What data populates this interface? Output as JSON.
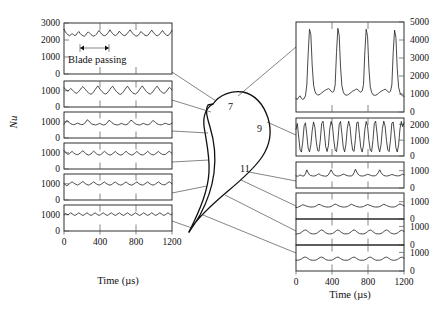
{
  "figure": {
    "title_hidden": "",
    "axis": {
      "y_label": "Nu",
      "x_label": "Time (µs)",
      "x_ticks": [
        "0",
        "400",
        "800",
        "1200"
      ],
      "x_range": [
        0,
        1200
      ]
    },
    "annotation": {
      "blade_passing_label": "Blade passing",
      "blade_passing_span_us": [
        180,
        480
      ]
    },
    "blade": {
      "name": "turbine-blade-cross-section",
      "labels": [
        {
          "text": "7",
          "x": 233,
          "y": 106
        },
        {
          "text": "9",
          "x": 262,
          "y": 128
        },
        {
          "text": "11",
          "x": 247,
          "y": 168
        }
      ]
    }
  },
  "chart_data": [
    {
      "id": "left-panel-1",
      "type": "line",
      "side": "left",
      "position": 1,
      "title": "",
      "xlabel": "Time (µs)",
      "ylabel": "Nu",
      "xlim": [
        0,
        1200
      ],
      "ylim": [
        0,
        3000
      ],
      "y_ticks": [
        0,
        1000,
        2000,
        3000
      ],
      "x_ticks": [
        0,
        400,
        800,
        1200
      ],
      "grid": false,
      "annotation": "Blade passing",
      "mean": 2300,
      "x": [
        0,
        15,
        30,
        45,
        60,
        75,
        90,
        105,
        120,
        135,
        150,
        165,
        180,
        195,
        210,
        225,
        240,
        255,
        270,
        285,
        300,
        315,
        330,
        345,
        360,
        375,
        390,
        405,
        420,
        435,
        450,
        465,
        480,
        495,
        510,
        525,
        540,
        555,
        570,
        585,
        600,
        615,
        630,
        645,
        660,
        675,
        690,
        705,
        720,
        735,
        750,
        765,
        780,
        795,
        810,
        825,
        840,
        855,
        870,
        885,
        900,
        915,
        930,
        945,
        960,
        975,
        990,
        1005,
        1020,
        1035,
        1050,
        1065,
        1080,
        1095,
        1110,
        1125,
        1140,
        1155,
        1170,
        1185,
        1200
      ],
      "values": [
        2620,
        2480,
        2380,
        2300,
        2250,
        2300,
        2380,
        2300,
        2260,
        2300,
        2420,
        2500,
        2380,
        2300,
        2250,
        2220,
        2280,
        2400,
        2480,
        2400,
        2320,
        2260,
        2230,
        2260,
        2340,
        2460,
        2560,
        2440,
        2340,
        2280,
        2250,
        2280,
        2360,
        2460,
        2600,
        2480,
        2380,
        2300,
        2260,
        2300,
        2400,
        2520,
        2420,
        2330,
        2280,
        2260,
        2300,
        2400,
        2500,
        2600,
        2480,
        2380,
        2300,
        2250,
        2230,
        2280,
        2380,
        2500,
        2420,
        2340,
        2280,
        2250,
        2280,
        2360,
        2480,
        2580,
        2460,
        2360,
        2290,
        2250,
        2280,
        2360,
        2460,
        2560,
        2440,
        2340,
        2280,
        2260,
        2320,
        2440,
        2560
      ]
    },
    {
      "id": "left-panel-2",
      "type": "line",
      "side": "left",
      "position": 2,
      "xlim": [
        0,
        1200
      ],
      "ylim": [
        0,
        1600
      ],
      "y_ticks": [
        0,
        1000
      ],
      "mean": 950,
      "values": [
        1180,
        1120,
        1020,
        980,
        1060,
        1140,
        1060,
        980,
        900,
        840,
        880,
        960,
        1060,
        1180,
        1260,
        1160,
        1060,
        960,
        880,
        820,
        780,
        840,
        940,
        1060,
        1180,
        1300,
        1180,
        1060,
        960,
        880,
        820,
        800,
        860,
        960,
        1080,
        1200,
        1280,
        1160,
        1040,
        940,
        860,
        800,
        780,
        840,
        940,
        1060,
        1180,
        1280,
        1160,
        1040,
        940,
        860,
        820,
        800,
        860,
        960,
        1080,
        1200,
        1300,
        1180,
        1060,
        960,
        880,
        820,
        800,
        860,
        960,
        1080,
        1200,
        1280,
        1160,
        1040,
        940,
        880,
        840,
        880,
        980,
        1100,
        1200,
        1140,
        1060
      ]
    },
    {
      "id": "left-panel-3",
      "type": "line",
      "side": "left",
      "position": 3,
      "xlim": [
        0,
        1200
      ],
      "ylim": [
        0,
        1600
      ],
      "y_ticks": [
        0,
        1000
      ],
      "mean": 880,
      "values": [
        860,
        960,
        1080,
        1020,
        940,
        880,
        840,
        820,
        840,
        880,
        920,
        880,
        840,
        820,
        840,
        900,
        1000,
        1120,
        1060,
        960,
        880,
        840,
        820,
        800,
        820,
        860,
        900,
        860,
        820,
        800,
        820,
        880,
        980,
        1100,
        1040,
        950,
        880,
        840,
        820,
        800,
        820,
        860,
        900,
        870,
        830,
        810,
        830,
        890,
        990,
        1100,
        1040,
        960,
        890,
        840,
        820,
        800,
        820,
        860,
        900,
        870,
        830,
        810,
        830,
        880,
        980,
        1080,
        1020,
        950,
        880,
        840,
        820,
        810,
        830,
        870,
        910,
        880,
        850,
        830,
        860,
        920
      ]
    },
    {
      "id": "left-panel-4",
      "type": "line",
      "side": "left",
      "position": 4,
      "xlim": [
        0,
        1200
      ],
      "ylim": [
        0,
        1600
      ],
      "y_ticks": [
        0,
        1000
      ],
      "mean": 930,
      "values": [
        1140,
        1040,
        960,
        900,
        940,
        1020,
        1080,
        1000,
        940,
        900,
        880,
        920,
        980,
        1060,
        1120,
        1040,
        960,
        900,
        860,
        880,
        940,
        1020,
        1100,
        1020,
        940,
        890,
        860,
        880,
        940,
        1020,
        1090,
        1010,
        940,
        890,
        860,
        880,
        940,
        1010,
        1080,
        1000,
        930,
        880,
        860,
        880,
        940,
        1020,
        1090,
        1010,
        940,
        890,
        860,
        880,
        940,
        1010,
        1080,
        1000,
        930,
        880,
        860,
        880,
        940,
        1010,
        1090,
        1010,
        940,
        890,
        870,
        890,
        950,
        1020,
        1080,
        1000,
        940,
        900,
        880,
        900,
        960,
        1030,
        1090,
        1020,
        960
      ]
    },
    {
      "id": "left-panel-5",
      "type": "line",
      "side": "left",
      "position": 5,
      "xlim": [
        0,
        1200
      ],
      "ylim": [
        0,
        1600
      ],
      "y_ticks": [
        0,
        1000
      ],
      "mean": 960,
      "values": [
        1000,
        940,
        880,
        920,
        1000,
        1060,
        1120,
        1060,
        1000,
        960,
        920,
        960,
        1020,
        1080,
        1140,
        1060,
        1000,
        950,
        920,
        940,
        1000,
        1060,
        1120,
        1050,
        990,
        950,
        920,
        940,
        1000,
        1060,
        1110,
        1040,
        980,
        940,
        920,
        940,
        1000,
        1060,
        1110,
        1040,
        980,
        940,
        920,
        940,
        1000,
        1060,
        1110,
        1040,
        980,
        940,
        920,
        940,
        1000,
        1060,
        1110,
        1040,
        980,
        940,
        920,
        940,
        1000,
        1060,
        1110,
        1040,
        980,
        940,
        920,
        940,
        1000,
        1060,
        1110,
        1050,
        990,
        950,
        930,
        950,
        1010,
        1070,
        1120,
        1060,
        1000
      ]
    },
    {
      "id": "left-panel-6",
      "type": "line",
      "side": "left",
      "position": 6,
      "xlim": [
        0,
        1200
      ],
      "ylim": [
        0,
        1600
      ],
      "y_ticks": [
        0,
        1000
      ],
      "mean": 990,
      "values": [
        1020,
        1080,
        1040,
        1000,
        1060,
        1120,
        1060,
        1000,
        960,
        1000,
        1060,
        1120,
        1060,
        1000,
        960,
        1000,
        1060,
        1120,
        1060,
        1000,
        960,
        1000,
        1060,
        1120,
        1060,
        1000,
        960,
        1000,
        1060,
        1120,
        1060,
        1000,
        960,
        1000,
        1060,
        1120,
        1060,
        1000,
        960,
        1000,
        1060,
        1120,
        1060,
        1000,
        960,
        1000,
        1060,
        1120,
        1060,
        1000,
        960,
        1000,
        1060,
        1120,
        1060,
        1000,
        960,
        1000,
        1060,
        1120,
        1060,
        1000,
        960,
        1000,
        1060,
        1120,
        1060,
        1000,
        960,
        1000,
        1060,
        1120,
        1060,
        1000,
        960,
        1000,
        1060,
        1120,
        1060,
        1000,
        1040
      ]
    },
    {
      "id": "right-panel-1",
      "type": "line",
      "side": "right",
      "position": 1,
      "xlim": [
        0,
        1200
      ],
      "ylim": [
        0,
        5000
      ],
      "y_ticks": [
        0,
        1000,
        2000,
        3000,
        4000,
        5000
      ],
      "x_ticks": [
        0,
        400,
        800,
        1200
      ],
      "peak_count": 4,
      "peak_value": 4600,
      "baseline": 800,
      "values": [
        750,
        700,
        820,
        900,
        760,
        700,
        740,
        900,
        1500,
        3200,
        4600,
        4300,
        2600,
        1500,
        1150,
        1000,
        950,
        950,
        1000,
        1060,
        1120,
        1180,
        1220,
        1260,
        1300,
        1250,
        1150,
        1100,
        1150,
        1500,
        3300,
        4650,
        4250,
        2500,
        1450,
        1120,
        980,
        940,
        940,
        980,
        1040,
        1100,
        1160,
        1200,
        1240,
        1280,
        1230,
        1140,
        1100,
        1160,
        1520,
        3350,
        4600,
        4200,
        2450,
        1400,
        1100,
        960,
        930,
        930,
        970,
        1030,
        1090,
        1150,
        1190,
        1230,
        1270,
        1220,
        1130,
        1090,
        1150,
        1500,
        3300,
        4550,
        4150,
        2400,
        1380,
        1080,
        950,
        900,
        880
      ]
    },
    {
      "id": "right-panel-2",
      "type": "line",
      "side": "right",
      "position": 2,
      "xlim": [
        0,
        1200
      ],
      "ylim": [
        0,
        2400
      ],
      "y_ticks": [
        0,
        1000,
        2000
      ],
      "oscillation_range": [
        200,
        2250
      ],
      "values": [
        1700,
        2050,
        1200,
        400,
        250,
        900,
        1900,
        2100,
        1350,
        500,
        260,
        700,
        1600,
        2150,
        1800,
        900,
        350,
        300,
        1000,
        2050,
        2200,
        1500,
        600,
        280,
        650,
        1700,
        2180,
        1900,
        1000,
        380,
        280,
        950,
        2000,
        2180,
        1400,
        550,
        260,
        750,
        1750,
        2200,
        1850,
        950,
        360,
        290,
        1050,
        2100,
        2150,
        1350,
        520,
        250,
        680,
        1680,
        2180,
        1880,
        980,
        370,
        270,
        980,
        2050,
        2200,
        1450,
        560,
        260,
        720,
        1720,
        2200,
        1900,
        1000,
        380,
        280,
        1000,
        2080,
        2150,
        1400,
        540,
        250,
        700,
        1700,
        2180,
        1850,
        2100
      ]
    },
    {
      "id": "right-panel-3",
      "type": "line",
      "side": "right",
      "position": 3,
      "xlim": [
        0,
        1200
      ],
      "ylim": [
        0,
        1500
      ],
      "y_ticks": [
        0,
        1000
      ],
      "baseline": 700,
      "values": [
        700,
        680,
        700,
        760,
        720,
        690,
        700,
        820,
        1050,
        880,
        760,
        720,
        700,
        690,
        700,
        730,
        780,
        820,
        760,
        720,
        700,
        690,
        680,
        700,
        760,
        900,
        1050,
        900,
        780,
        730,
        700,
        690,
        700,
        720,
        760,
        800,
        780,
        740,
        710,
        700,
        690,
        700,
        740,
        880,
        1080,
        920,
        790,
        730,
        700,
        690,
        700,
        720,
        760,
        790,
        770,
        740,
        710,
        700,
        700,
        720,
        780,
        900,
        1050,
        890,
        780,
        730,
        700,
        690,
        700,
        720,
        750,
        780,
        760,
        730,
        710,
        700,
        700,
        720,
        760,
        800,
        760
      ]
    },
    {
      "id": "right-panel-4",
      "type": "line",
      "side": "right",
      "position": 4,
      "xlim": [
        0,
        1200
      ],
      "ylim": [
        0,
        1500
      ],
      "y_ticks": [
        0,
        1000
      ],
      "baseline": 680,
      "values": [
        660,
        670,
        700,
        740,
        780,
        820,
        800,
        770,
        740,
        720,
        700,
        690,
        690,
        700,
        720,
        760,
        810,
        850,
        820,
        780,
        740,
        720,
        700,
        690,
        690,
        700,
        720,
        770,
        820,
        860,
        830,
        790,
        750,
        720,
        700,
        690,
        690,
        700,
        720,
        760,
        810,
        850,
        820,
        780,
        750,
        720,
        700,
        690,
        690,
        700,
        720,
        760,
        800,
        840,
        810,
        780,
        750,
        720,
        700,
        690,
        690,
        700,
        720,
        760,
        810,
        850,
        820,
        780,
        750,
        720,
        700,
        690,
        690,
        700,
        730,
        780,
        830,
        870,
        840,
        800,
        760
      ]
    },
    {
      "id": "right-panel-5",
      "type": "line",
      "side": "right",
      "position": 5,
      "xlim": [
        0,
        1200
      ],
      "ylim": [
        0,
        1400
      ],
      "y_ticks": [
        0,
        1000
      ],
      "baseline": 600,
      "values": [
        600,
        600,
        610,
        630,
        680,
        740,
        790,
        810,
        780,
        720,
        660,
        620,
        600,
        600,
        600,
        620,
        660,
        720,
        780,
        810,
        780,
        720,
        660,
        620,
        600,
        600,
        600,
        620,
        660,
        720,
        780,
        810,
        780,
        720,
        660,
        620,
        600,
        600,
        600,
        620,
        660,
        720,
        780,
        810,
        780,
        720,
        660,
        620,
        600,
        600,
        600,
        620,
        660,
        720,
        780,
        810,
        780,
        720,
        660,
        620,
        600,
        600,
        600,
        620,
        660,
        720,
        780,
        810,
        780,
        720,
        660,
        620,
        600,
        600,
        610,
        640,
        690,
        750,
        790,
        770,
        720
      ]
    },
    {
      "id": "right-panel-6",
      "type": "line",
      "side": "right",
      "position": 6,
      "xlim": [
        0,
        1200
      ],
      "ylim": [
        0,
        1400
      ],
      "y_ticks": [
        0,
        1000
      ],
      "baseline": 580,
      "values": [
        580,
        580,
        590,
        610,
        650,
        700,
        740,
        750,
        720,
        670,
        620,
        590,
        580,
        580,
        580,
        600,
        640,
        690,
        730,
        750,
        720,
        670,
        620,
        590,
        580,
        580,
        580,
        600,
        640,
        690,
        730,
        750,
        720,
        670,
        620,
        590,
        580,
        580,
        580,
        600,
        640,
        690,
        730,
        750,
        720,
        670,
        620,
        590,
        580,
        580,
        580,
        600,
        640,
        690,
        730,
        750,
        720,
        670,
        620,
        590,
        580,
        580,
        580,
        600,
        640,
        690,
        730,
        750,
        720,
        670,
        620,
        590,
        580,
        580,
        590,
        620,
        660,
        710,
        745,
        730,
        690
      ]
    }
  ]
}
